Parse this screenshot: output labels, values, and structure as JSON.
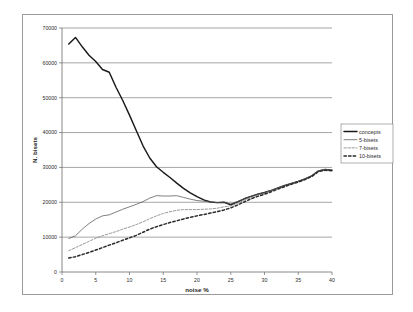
{
  "chart_data": {
    "type": "line",
    "title": "",
    "xlabel": "noise %",
    "ylabel": "N. bisets",
    "xlim": [
      0,
      40
    ],
    "ylim": [
      0,
      70000
    ],
    "grid": true,
    "legend_position": "right",
    "xticks": [
      "0",
      "5",
      "10",
      "15",
      "20",
      "25",
      "30",
      "35",
      "40"
    ],
    "yticks": [
      "0",
      "10000",
      "20000",
      "30000",
      "40000",
      "50000",
      "60000",
      "70000"
    ],
    "x": [
      1,
      2,
      3,
      4,
      5,
      6,
      7,
      8,
      9,
      10,
      11,
      12,
      13,
      14,
      15,
      16,
      17,
      18,
      19,
      20,
      21,
      22,
      23,
      24,
      25,
      26,
      27,
      28,
      29,
      30,
      31,
      32,
      33,
      34,
      35,
      36,
      37,
      38,
      39,
      40
    ],
    "series": [
      {
        "name": "concepts",
        "style": "solid-thick",
        "color": "#1a1a1a",
        "values": [
          65400,
          67300,
          64600,
          62200,
          60400,
          58100,
          57300,
          53000,
          49200,
          45000,
          40600,
          36200,
          32700,
          30200,
          28600,
          27100,
          25500,
          24000,
          22700,
          21600,
          20700,
          20100,
          19900,
          20000,
          19300,
          20100,
          21000,
          21700,
          22300,
          22800,
          23400,
          24100,
          24800,
          25400,
          26000,
          26700,
          27600,
          29000,
          29400,
          29200
        ]
      },
      {
        "name": "5-bisets",
        "style": "solid-thin",
        "color": "#555555",
        "values": [
          9600,
          10400,
          12300,
          13900,
          15200,
          16100,
          16400,
          17200,
          18000,
          18700,
          19400,
          20200,
          21200,
          21900,
          21800,
          21800,
          21900,
          21400,
          20900,
          20500,
          20300,
          20100,
          19900,
          20000,
          19500,
          20200,
          21000,
          21700,
          22300,
          22800,
          23400,
          24100,
          24800,
          25400,
          26000,
          26700,
          27600,
          29000,
          29400,
          29200
        ]
      },
      {
        "name": "7-bisets",
        "style": "dashed-fine",
        "color": "#777777",
        "values": [
          6100,
          7000,
          7900,
          8800,
          9700,
          10400,
          11000,
          11600,
          12300,
          12900,
          13600,
          14400,
          15300,
          16100,
          16800,
          17300,
          17700,
          17900,
          17900,
          17900,
          18000,
          18100,
          18300,
          18700,
          19000,
          19700,
          20600,
          21400,
          22100,
          22600,
          23300,
          24000,
          24700,
          25300,
          25900,
          26600,
          27500,
          28900,
          29300,
          29100
        ]
      },
      {
        "name": "10-bisets",
        "style": "dotted-thick",
        "color": "#2b2b2b",
        "values": [
          4000,
          4400,
          5000,
          5600,
          6300,
          7000,
          7700,
          8400,
          9100,
          9800,
          10500,
          11400,
          12300,
          13000,
          13600,
          14200,
          14700,
          15200,
          15700,
          16100,
          16500,
          16900,
          17300,
          17800,
          18400,
          19200,
          20100,
          21000,
          21700,
          22300,
          23000,
          23800,
          24500,
          25200,
          25800,
          26500,
          27400,
          28800,
          29200,
          29000
        ]
      }
    ]
  },
  "legend": {
    "entries": [
      {
        "label": "concepts"
      },
      {
        "label": "5-bisets"
      },
      {
        "label": "7-bisets"
      },
      {
        "label": "10-bisets"
      }
    ]
  }
}
